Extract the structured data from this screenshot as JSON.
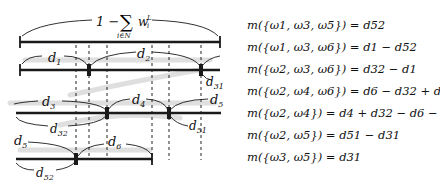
{
  "diagram": {
    "top_label": "1 − ∑ w",
    "top_label_sup": "L",
    "top_label_sub_i": "i",
    "top_label_under": "i∈N",
    "labels": {
      "d1": "d",
      "d1_sub": "1",
      "d2": "d",
      "d2_sub": "2",
      "d31": "d",
      "d31_sub": "31",
      "d3": "d",
      "d3_sub": "3",
      "d32": "d",
      "d32_sub": "32",
      "d4": "d",
      "d4_sub": "4",
      "d5a": "d",
      "d5a_sub": "5",
      "d51": "d",
      "d51_sub": "51",
      "d5b": "d",
      "d5b_sub": "5",
      "d6": "d",
      "d6_sub": "6",
      "d52": "d",
      "d52_sub": "52"
    },
    "bar_color": "#1a1a1a",
    "shadow_color": "#d8d8d8"
  },
  "equations": [
    "m({ω1, ω3, ω5}) = d52",
    "m({ω1, ω3, ω6}) = d1 − d52",
    "m({ω2, ω3, ω6}) = d32 − d1",
    "m({ω2, ω4, ω6}) = d6 − d32 + d52",
    "m({ω2, ω4}) = d4 + d32 − d6 − d52",
    "m({ω2, ω5}) = d51 − d31",
    "m({ω3, ω5}) = d31"
  ]
}
